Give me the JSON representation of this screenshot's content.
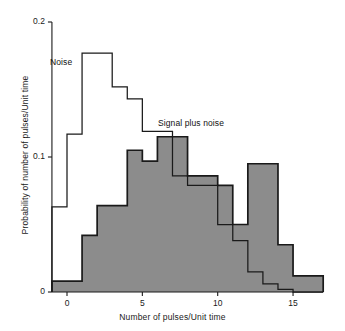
{
  "figure": {
    "background": "#ffffff",
    "noise_color": "#1a1a1a",
    "signal_fill": "#8c8c8c",
    "signal_stroke": "#1a1a1a"
  },
  "labels": {
    "noise": "Noise",
    "signal": "Signal plus noise"
  },
  "axes": {
    "x_title": "Number of pulses/Unit time",
    "y_title": "Probability of number of pulses/Unit time",
    "x_ticks": [
      "0",
      "5",
      "10",
      "15"
    ],
    "x_tick_values": [
      0,
      5,
      10,
      15
    ],
    "y_ticks": [
      "0",
      "0.1",
      "0.2"
    ],
    "y_tick_values": [
      0,
      0.1,
      0.2
    ]
  },
  "chart_data": {
    "type": "bar",
    "title": "",
    "subtitle": "",
    "xlabel": "Number of pulses/Unit time",
    "ylabel": "Probability of number of pulses/Unit time",
    "xlim": [
      -1,
      17
    ],
    "ylim": [
      0,
      0.2
    ],
    "grid": false,
    "legend": "inline-annotations",
    "bin_width": 1,
    "bin_starts": [
      -1,
      0,
      1,
      2,
      3,
      4,
      5,
      6,
      7,
      8,
      9,
      10,
      11,
      12,
      13,
      14,
      15,
      16
    ],
    "categories": [
      "-1",
      "0",
      "1",
      "2",
      "3",
      "4",
      "5",
      "6",
      "7",
      "8",
      "9",
      "10",
      "11",
      "12",
      "13",
      "14",
      "15",
      "16"
    ],
    "series": [
      {
        "name": "Noise",
        "style": "step-outline",
        "color": "#1a1a1a",
        "values": [
          0.063,
          0.117,
          0.177,
          0.177,
          0.152,
          0.143,
          0.119,
          0.119,
          0.086,
          0.079,
          0.079,
          0.05,
          0.038,
          0.015,
          0.006,
          0.002,
          0.0,
          0.0
        ]
      },
      {
        "name": "Signal plus noise",
        "style": "step-filled",
        "fill": "#8c8c8c",
        "color": "#1a1a1a",
        "values": [
          0.008,
          0.008,
          0.042,
          0.064,
          0.064,
          0.105,
          0.097,
          0.115,
          0.115,
          0.086,
          0.086,
          0.079,
          0.05,
          0.095,
          0.095,
          0.035,
          0.012,
          0.012
        ]
      }
    ],
    "annotations": [
      {
        "text": "Noise",
        "x": 0.4,
        "y": 0.175
      },
      {
        "text": "Signal plus noise",
        "x": 6.5,
        "y": 0.128
      }
    ]
  }
}
